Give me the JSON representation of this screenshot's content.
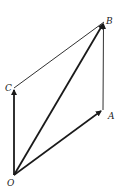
{
  "diagram": {
    "type": "vector-parallelogram",
    "points": {
      "O": {
        "label": "O",
        "x": 14,
        "y": 175
      },
      "A": {
        "label": "A",
        "x": 103,
        "y": 110
      },
      "B": {
        "label": "B",
        "x": 104,
        "y": 22
      },
      "C": {
        "label": "C",
        "x": 14,
        "y": 88
      }
    },
    "labels": {
      "O": "O",
      "A": "A",
      "B": "B",
      "C": "C"
    },
    "vectors": [
      {
        "from": "O",
        "to": "A",
        "style": "bold-arrow"
      },
      {
        "from": "O",
        "to": "B",
        "style": "bold-arrow"
      },
      {
        "from": "O",
        "to": "C",
        "style": "bold-arrow"
      },
      {
        "from": "A",
        "to": "B",
        "style": "thin-arrow"
      }
    ],
    "lines": [
      {
        "from": "C",
        "to": "B",
        "style": "thin"
      }
    ],
    "colors": {
      "stroke": "#1a1a1a",
      "background": "#ffffff"
    }
  }
}
